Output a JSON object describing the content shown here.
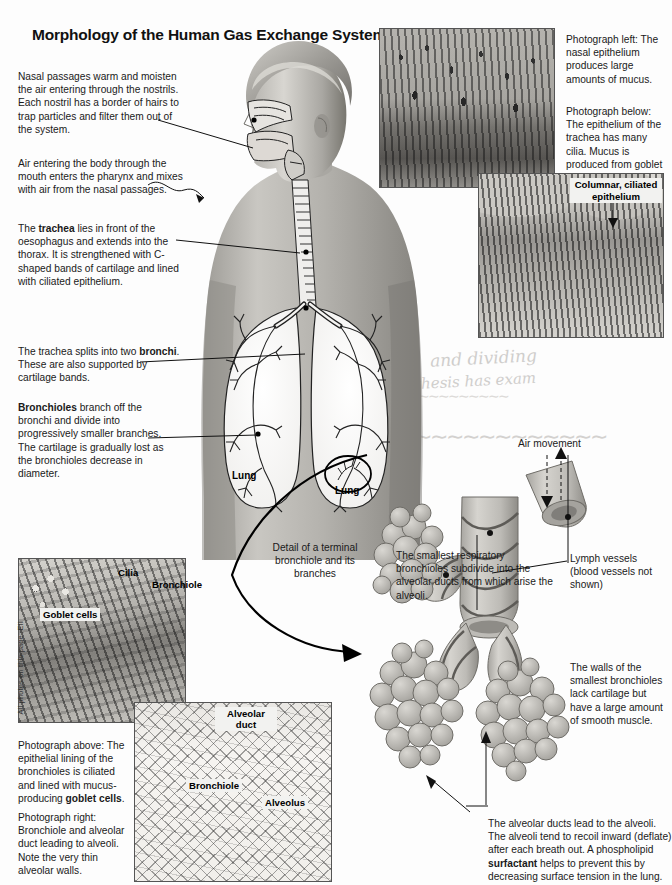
{
  "page": {
    "title": "Morphology of the Human Gas Exchange System",
    "credit": "All photos on this page: EII"
  },
  "left_notes": [
    {
      "id": "nasal-passages",
      "text": "Nasal passages warm and moisten the air entering through the nostrils. Each nostril has a border of hairs to trap particles and filter them out of the system."
    },
    {
      "id": "mouth-pharynx",
      "text": "Air entering the body through the mouth enters the pharynx and mixes with air from the nasal passages."
    },
    {
      "id": "trachea",
      "lead": "The ",
      "term": "trachea",
      "text": " lies in front of the oesophagus and extends into the thorax. It is strengthened with C-shaped bands of cartilage and lined with ciliated epithelium."
    },
    {
      "id": "bronchi",
      "lead": "The trachea splits into two ",
      "term": "bronchi",
      "text": ". These are also supported by cartilage bands."
    },
    {
      "id": "bronchioles",
      "lead": "",
      "term": "Bronchioles",
      "text": "  branch off the bronchi and divide into progressively smaller branches. The cartilage is gradually lost as the bronchioles decrease in diameter."
    }
  ],
  "right_notes": {
    "photo_left_caption": "Photograph left: The nasal epithelium produces large amounts of mucus.",
    "photo_below_caption": "Photograph below: The epithelium of the trachea has many cilia. Mucus is produced from goblet cells.",
    "columnar_label": "Columnar, ciliated epithelium",
    "air_movement": "Air movement",
    "smallest_bronchioles": "The smallest respiratory bronchioles subdivide into the alveolar ducts from which arise the alveoli.",
    "lymph_vessels": "Lymph vessels (blood vessels not shown)",
    "walls_note": "The walls of the smallest bronchioles lack cartilage but have a large amount of smooth muscle.",
    "alveolar_ducts_note_part1": "The alveolar ducts lead to the alveoli. The alveoli tend to recoil inward (deflate) after each breath out. A phospholipid ",
    "alveolar_ducts_term": "surfactant",
    "alveolar_ducts_note_part2": " helps to prevent this by decreasing surface tension in the lung."
  },
  "diagram_labels": {
    "lung_left": "Lung",
    "lung_right": "Lung",
    "detail_caption": "Detail of a terminal bronchiole and its branches"
  },
  "photo_bronchiole": {
    "cilia": "Cilia",
    "bronchiole": "Bronchiole",
    "goblet_cells": "Goblet cells"
  },
  "photo_alveolar": {
    "alveolar_duct": "Alveolar duct",
    "bronchiole": "Bronchiole",
    "alveolus": "Alveolus"
  },
  "bottom_left_captions": {
    "above_part1": "Photograph above: The epithelial lining of the bronchioles is ciliated and lined with mucus-producing ",
    "above_term": "goblet cells",
    "above_part2": ".",
    "right": "Photograph right: Bronchiole and alveolar duct leading to alveoli. Note the very thin alveolar walls."
  },
  "handwriting_bleed": [
    "and dividing",
    "thesis has exam"
  ],
  "colors": {
    "text": "#1a1a1a",
    "title": "#111111",
    "line": "#111111",
    "photo_border": "#555555",
    "label_bg": "#f2f2f0"
  }
}
